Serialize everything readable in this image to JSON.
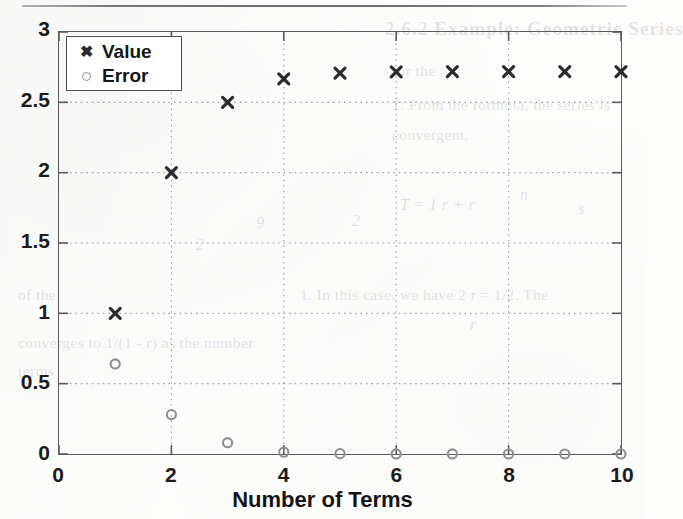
{
  "page": {
    "rule_present": true,
    "background_color": "#fdfdfc",
    "bleed_through": [
      {
        "text": "2.6.2   Example: Geometric Series",
        "x": 385,
        "y": 18,
        "kind": "b-head"
      },
      {
        "text": "1. From the formula, the series is",
        "x": 392,
        "y": 96,
        "kind": "b-body"
      },
      {
        "text": "convergent.",
        "x": 392,
        "y": 126,
        "kind": "b-body"
      },
      {
        "text": "for the",
        "x": 392,
        "y": 62,
        "kind": "b-body"
      },
      {
        "text": "T   =  1   r   +  r",
        "x": 400,
        "y": 196,
        "kind": "b-math"
      },
      {
        "text": "n",
        "x": 520,
        "y": 186,
        "kind": "b-math"
      },
      {
        "text": "1. In this case, we have 2 r = 1/2. The",
        "x": 300,
        "y": 286,
        "kind": "b-body"
      },
      {
        "text": "of the",
        "x": 18,
        "y": 286,
        "kind": "b-body"
      },
      {
        "text": "converges to 1/(1 - r) as the number",
        "x": 18,
        "y": 334,
        "kind": "b-body"
      },
      {
        "text": "terms",
        "x": 18,
        "y": 362,
        "kind": "b-body"
      },
      {
        "text": "9",
        "x": 256,
        "y": 214,
        "kind": "b-math"
      },
      {
        "text": "2",
        "x": 352,
        "y": 212,
        "kind": "b-math"
      },
      {
        "text": "s",
        "x": 578,
        "y": 200,
        "kind": "b-math"
      },
      {
        "text": "r",
        "x": 470,
        "y": 316,
        "kind": "b-math"
      },
      {
        "text": "2",
        "x": 196,
        "y": 236,
        "kind": "b-math"
      }
    ]
  },
  "chart_data": {
    "type": "scatter",
    "title": "",
    "xlabel": "Number of Terms",
    "ylabel": "",
    "xlim": [
      0,
      10
    ],
    "ylim": [
      0,
      3
    ],
    "xticks": [
      0,
      2,
      4,
      6,
      8,
      10
    ],
    "xtick_labels": [
      "0",
      "2",
      "4",
      "6",
      "8",
      "10"
    ],
    "yticks": [
      0,
      0.5,
      1,
      1.5,
      2,
      2.5,
      3
    ],
    "ytick_labels": [
      "0",
      "0.5",
      "1",
      "1.5",
      "2",
      "2.5",
      "3"
    ],
    "grid": true,
    "grid_style": "dotted",
    "legend_position": "upper left",
    "x": [
      1,
      2,
      3,
      4,
      5,
      6,
      7,
      8,
      9,
      10
    ],
    "series": [
      {
        "name": "Value",
        "marker": "x",
        "color": "#2b2b2f",
        "values": [
          1,
          2,
          2.5,
          2.667,
          2.708,
          2.717,
          2.718,
          2.718,
          2.718,
          2.718
        ]
      },
      {
        "name": "Error",
        "marker": "o",
        "color": "#8f8f95",
        "values": [
          0.64,
          0.28,
          0.08,
          0.013,
          0.0025,
          0.0004,
          0.0001,
          0,
          0,
          0
        ]
      }
    ]
  }
}
